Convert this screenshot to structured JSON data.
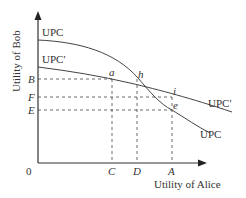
{
  "diagram": {
    "y_axis_label": "Utility of Bob",
    "x_axis_label": "Utility of Alice",
    "origin_label": "0",
    "curves": [
      {
        "name": "UPC",
        "label_top": "UPC",
        "label_bottom": "UPC"
      },
      {
        "name": "UPC'",
        "label_top": "UPC'",
        "label_bottom": "UPC'"
      }
    ],
    "y_ticks": [
      "B",
      "F",
      "E"
    ],
    "x_ticks": [
      "C",
      "D",
      "A"
    ],
    "points": [
      "a",
      "h",
      "i",
      "e"
    ]
  }
}
